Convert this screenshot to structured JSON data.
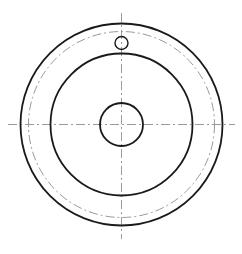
{
  "drawing": {
    "title": "Circular flange / pulley front view",
    "view_name": "front-view",
    "background_color": "#ffffff",
    "canvas": {
      "width": 242,
      "height": 254
    },
    "center": {
      "x": 121.5,
      "y": 124.5
    },
    "line_styles": {
      "visible_edge": {
        "name": "continuous-thick",
        "color": "#1a1a1a",
        "width": 1.8
      },
      "visible_edge_thin": {
        "name": "continuous-thin",
        "color": "#1a1a1a",
        "width": 1.4
      },
      "center_line": {
        "name": "dash-dot-thin",
        "color": "#8e8e8e",
        "width": 0.9,
        "dash_pattern": "9 3 2 3"
      }
    },
    "circles": [
      {
        "id": "outer-rim-circle",
        "label": "Outer rim diameter",
        "cx": 121.5,
        "cy": 124.5,
        "radius": 101,
        "diameter": 202,
        "style": "visible_edge"
      },
      {
        "id": "bolt-pitch-circle",
        "label": "Bolt hole pitch circle",
        "cx": 121.5,
        "cy": 124.5,
        "radius": 93,
        "diameter": 186,
        "style": "center_line"
      },
      {
        "id": "body-circle",
        "label": "Web / body diameter",
        "cx": 121.5,
        "cy": 124.5,
        "radius": 71,
        "diameter": 142,
        "style": "visible_edge"
      },
      {
        "id": "hub-bore-circle",
        "label": "Central bore diameter",
        "cx": 121.5,
        "cy": 124.5,
        "radius": 21.5,
        "diameter": 43,
        "style": "visible_edge"
      },
      {
        "id": "bolt-hole-circle",
        "label": "Bolt hole",
        "cx": 121.5,
        "cy": 43,
        "radius": 6.5,
        "diameter": 13,
        "style": "visible_edge_thin"
      }
    ],
    "center_lines": [
      {
        "id": "horizontal-center-line",
        "label": "Horizontal axis",
        "orientation": "horizontal",
        "x1": 8,
        "y1": 124.5,
        "x2": 235,
        "y2": 124.5
      },
      {
        "id": "vertical-center-line",
        "label": "Vertical axis",
        "orientation": "vertical",
        "x1": 121.5,
        "y1": 13,
        "x2": 121.5,
        "y2": 239
      }
    ]
  }
}
